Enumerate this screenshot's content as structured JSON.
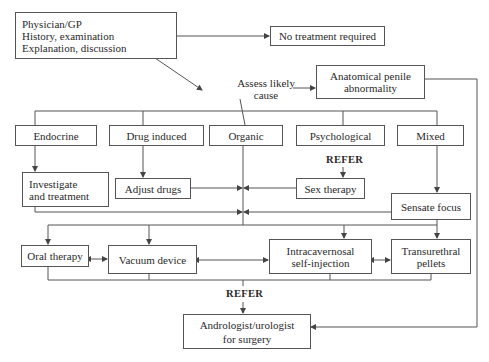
{
  "nodes": {
    "physician": "Physician/GP\nHistory, examination\nExplanation, discussion",
    "no_treatment": "No treatment required",
    "assess": "Assess likely\ncause",
    "anatomical": "Anatomical penile\nabnormality",
    "endocrine": "Endocrine",
    "drug_induced": "Drug induced",
    "organic": "Organic",
    "psychological": "Psychological",
    "mixed": "Mixed",
    "investigate": "Investigate\nand treatment",
    "adjust_drugs": "Adjust drugs",
    "sex_therapy": "Sex therapy",
    "sensate_focus": "Sensate focus",
    "oral_therapy": "Oral therapy",
    "vacuum_device": "Vacuum device",
    "intracavernosal": "Intracavernosal\nself-injection",
    "transurethral": "Transurethral\npellets",
    "andrologist": "Andrologist/urologist\nfor surgery"
  },
  "labels": {
    "refer_psych": "REFER",
    "refer_surgery": "REFER"
  },
  "colors": {
    "line": "#555555",
    "text": "#2a2a2a"
  }
}
